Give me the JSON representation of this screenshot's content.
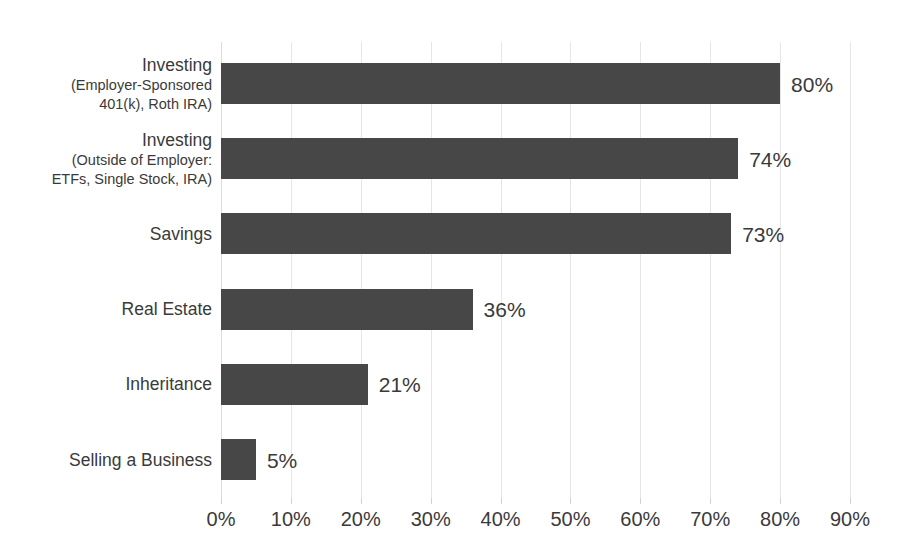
{
  "chart_data": {
    "type": "bar",
    "orientation": "horizontal",
    "title": "",
    "subtitle": "",
    "xlabel": "",
    "ylabel": "",
    "xlim": [
      0,
      90
    ],
    "grid": true,
    "legend": false,
    "legend_position": "none",
    "bar_color": "#474747",
    "gridline_color": "#e6e6e6",
    "text_color": "#3a3a3a",
    "background_color": "#ffffff",
    "xtick_values": [
      0,
      10,
      20,
      30,
      40,
      50,
      60,
      70,
      80,
      90
    ],
    "xtick_labels": [
      "0%",
      "10%",
      "20%",
      "30%",
      "40%",
      "50%",
      "60%",
      "70%",
      "80%",
      "90%"
    ],
    "categories": [
      "Investing (Employer-Sponsored 401(k), Roth IRA)",
      "Investing (Outside of Employer: ETFs, Single Stock, IRA)",
      "Savings",
      "Real Estate",
      "Inheritance",
      "Selling a Business"
    ],
    "values": [
      80,
      74,
      73,
      36,
      21,
      5
    ],
    "value_labels": [
      "80%",
      "74%",
      "73%",
      "36%",
      "21%",
      "5%"
    ],
    "bars": [
      {
        "label_lines": [
          "Investing",
          "(Employer-Sponsored",
          "401(k), Roth IRA)"
        ],
        "value": 80,
        "value_label": "80%"
      },
      {
        "label_lines": [
          "Investing",
          "(Outside of Employer:",
          "ETFs, Single Stock, IRA)"
        ],
        "value": 74,
        "value_label": "74%"
      },
      {
        "label_lines": [
          "Savings"
        ],
        "value": 73,
        "value_label": "73%"
      },
      {
        "label_lines": [
          "Real Estate"
        ],
        "value": 36,
        "value_label": "36%"
      },
      {
        "label_lines": [
          "Inheritance"
        ],
        "value": 21,
        "value_label": "21%"
      },
      {
        "label_lines": [
          "Selling a Business"
        ],
        "value": 5,
        "value_label": "5%"
      }
    ]
  }
}
